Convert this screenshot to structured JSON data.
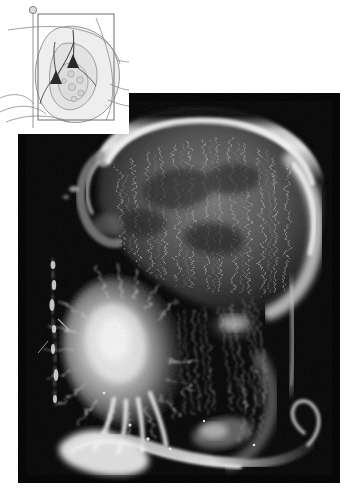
{
  "figure": {
    "kind": "fluorescence-micrograph-with-schematic-inset",
    "background_color": "#ffffff",
    "caption_text": ""
  },
  "micrograph": {
    "name": "fluorescence-micrograph",
    "background_color": "#050505",
    "frame": {
      "x": 18,
      "y": 93,
      "width": 322,
      "height": 390
    },
    "notch": {
      "x": 18,
      "y": 93,
      "width": 110,
      "height": 40
    },
    "description": "Dark-field fluorescence photomicrograph of a coronal brain section showing a brightly labelled cortical band (upper) and an intensely labelled nucleus with radiating fibres (lower left), connected by a fascicle of labelled axons.",
    "features": [
      {
        "label": "cortical-band",
        "tone": "bright-white-rim"
      },
      {
        "label": "cortical-fibre-array",
        "tone": "mid-grey-striations"
      },
      {
        "label": "labelled-nucleus",
        "tone": "bright-white-blob"
      },
      {
        "label": "descending-fascicle",
        "tone": "grey-fibre-bundle"
      },
      {
        "label": "ventral-tract",
        "tone": "bright-white-streak"
      },
      {
        "label": "lateral-fibre-strand",
        "tone": "dim-white-beaded-line"
      }
    ]
  },
  "inset": {
    "name": "schematic-inset",
    "background_color": "#ffffff",
    "outline_color": "#6e6e6e",
    "fill_color": "#e9e9e9",
    "neuron_color": "#2a2a2a",
    "frame": {
      "x": 0,
      "y": 0,
      "width": 129,
      "height": 134
    },
    "description": "Line-drawing schematic of a coronal hemisection with a boxed region of interest, a marker pin at upper left and two filled triangular (pyramidal) neuron somata joined by their processes.",
    "elements": [
      {
        "label": "hemisection-outline",
        "type": "contour"
      },
      {
        "label": "roi-box",
        "type": "rectangle"
      },
      {
        "label": "marker-pin",
        "type": "circle-on-stalk"
      },
      {
        "label": "pyramidal-neuron-upper",
        "type": "filled-triangle"
      },
      {
        "label": "pyramidal-neuron-lower",
        "type": "filled-triangle"
      },
      {
        "label": "neurite-tract",
        "type": "line"
      },
      {
        "label": "subregion-outline",
        "type": "contour"
      },
      {
        "label": "nucleus-cluster",
        "type": "small-circles"
      }
    ]
  }
}
